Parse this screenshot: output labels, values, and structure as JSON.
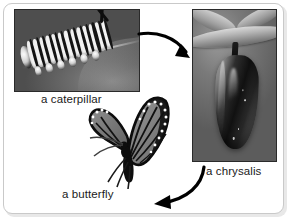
{
  "diagram": {
    "style": "photo collage with curved flow arrows",
    "frame_color": "#c9c9c9",
    "background_color": "#ffffff",
    "text_color": "#1a1a1a"
  },
  "stages": [
    {
      "id": "caterpillar",
      "label": "a caterpillar",
      "media": "grayscale-photo",
      "subject": "striped monarch caterpillar resting on a leaf",
      "position": "top-left"
    },
    {
      "id": "chrysalis",
      "label": "a chrysalis",
      "media": "grayscale-photo",
      "subject": "monarch chrysalis hanging from a stem",
      "position": "right"
    },
    {
      "id": "butterfly",
      "label": "a butterfly",
      "media": "illustration",
      "subject": "monarch butterfly with open patterned wings",
      "position": "bottom-center"
    }
  ],
  "arrows": [
    {
      "id": "arrow-caterpillar-to-chrysalis",
      "from": "caterpillar",
      "to": "chrysalis",
      "direction": "right-down",
      "color": "#000000"
    },
    {
      "id": "arrow-chrysalis-to-butterfly",
      "from": "chrysalis",
      "to": "butterfly",
      "direction": "left-down",
      "color": "#000000"
    }
  ]
}
